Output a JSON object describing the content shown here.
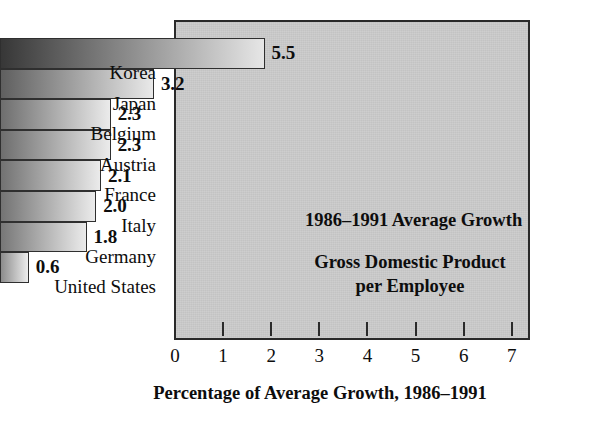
{
  "chart_data": {
    "type": "bar",
    "orientation": "horizontal",
    "title": "",
    "categories": [
      "Korea",
      "Japan",
      "Belgium",
      "Austria",
      "France",
      "Italy",
      "Germany",
      "United States"
    ],
    "values": [
      5.5,
      3.2,
      2.3,
      2.3,
      2.1,
      2.0,
      1.8,
      0.6
    ],
    "value_labels": [
      "5.5",
      "3.2",
      "2.3",
      "2.3",
      "2.1",
      "2.0",
      "1.8",
      "0.6"
    ],
    "xlabel": "Percentage of Average Growth, 1986–1991",
    "ylabel": "",
    "xlim": [
      0,
      7.4
    ],
    "xticks": [
      0,
      1,
      2,
      3,
      4,
      5,
      6,
      7
    ],
    "xticklabels": [
      "0",
      "1",
      "2",
      "3",
      "4",
      "5",
      "6",
      "7"
    ],
    "grid": false,
    "legend": false,
    "annotations": [
      "1986–1991 Average Growth",
      "Gross Domestic Product",
      "per Employee"
    ]
  },
  "annotations": {
    "growth_note": "1986–1991 Average Growth",
    "gdp_line1": "Gross Domestic Product",
    "gdp_line2": "per Employee"
  },
  "axis": {
    "x_title": "Percentage of Average Growth, 1986–1991"
  },
  "colors": {
    "panel_background": "#c9c9c9",
    "frame_border": "#2a2a2a",
    "bar_outline": "#2f2f2f",
    "text": "#0d0d0d",
    "page_background": "#ffffff",
    "bar_gradient_dark": "#6e6e6e",
    "bar_gradient_light": "#eaeaea"
  }
}
